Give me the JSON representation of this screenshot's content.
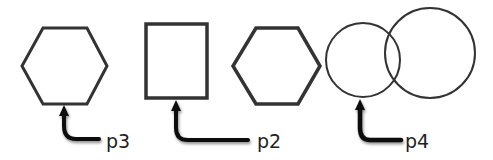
{
  "diagram": {
    "shapes": [
      {
        "id": "hexagon-1",
        "type": "hexagon"
      },
      {
        "id": "rectangle-1",
        "type": "rectangle"
      },
      {
        "id": "hexagon-2",
        "type": "hexagon"
      },
      {
        "id": "circle-1",
        "type": "circle"
      },
      {
        "id": "circle-2",
        "type": "circle"
      }
    ],
    "callouts": [
      {
        "label": "p3",
        "target": "hexagon-1 bottom edge"
      },
      {
        "label": "p2",
        "target": "rectangle-1 bottom edge"
      },
      {
        "label": "p4",
        "target": "circle-1 bottom"
      }
    ],
    "colors": {
      "stroke": "#333333",
      "arrow": "#111111",
      "background": "#ffffff"
    }
  }
}
